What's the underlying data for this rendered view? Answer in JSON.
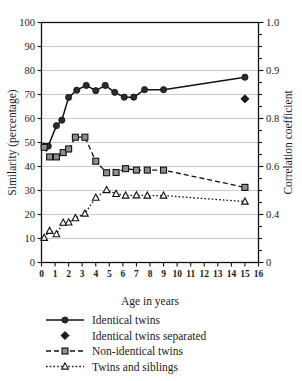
{
  "chart_data": {
    "type": "line",
    "title": "",
    "xlabel": "Age in years",
    "ylabel": "Similarity (percentage)",
    "y2label": "Correlation coefficient",
    "xlim": [
      0,
      16
    ],
    "ylim": [
      0,
      100
    ],
    "grid": true,
    "legend_position": "below",
    "xticks": [
      0,
      1,
      2,
      3,
      4,
      5,
      6,
      7,
      8,
      9,
      10,
      11,
      12,
      13,
      14,
      15,
      16
    ],
    "xtick_labels": [
      "0",
      "1",
      "2",
      "3",
      "4",
      "5",
      "6",
      "7",
      "8",
      "9",
      "10",
      "11",
      "12",
      "13",
      "14",
      "15",
      "16"
    ],
    "yticks": [
      0,
      10,
      20,
      30,
      40,
      50,
      60,
      70,
      80,
      90,
      100
    ],
    "ytick_labels": [
      "0",
      "10",
      "20",
      "30",
      "40",
      "50",
      "60",
      "70",
      "80",
      "90",
      "100"
    ],
    "y2_ticks_at_percent": [
      0,
      20,
      40,
      60,
      80,
      100
    ],
    "y2_tick_labels": [
      "0",
      "0.4",
      "0.6",
      "0.8",
      "0.9",
      "1.0"
    ],
    "y2_minor_ticks_at_percent": [
      5,
      10,
      15,
      25,
      30,
      35,
      45,
      50,
      55,
      65,
      70,
      75,
      85,
      90,
      95
    ],
    "series": [
      {
        "name": "Identical twins",
        "marker": "filled-circle",
        "linestyle": "solid",
        "x": [
          0.2,
          0.5,
          1.1,
          1.5,
          2.0,
          2.6,
          3.3,
          4.0,
          4.7,
          5.4,
          6.1,
          6.8,
          7.6,
          9.0,
          15.0
        ],
        "y": [
          48.5,
          48.5,
          57.0,
          59.3,
          68.8,
          71.8,
          73.8,
          71.6,
          73.8,
          70.9,
          68.9,
          68.9,
          72.0,
          72.0,
          77.2
        ]
      },
      {
        "name": "Identical twins separated",
        "marker": "filled-diamond",
        "linestyle": "none",
        "x": [
          15.0
        ],
        "y": [
          68.2
        ]
      },
      {
        "name": "Non-identical twins",
        "marker": "grey-square",
        "linestyle": "dashed",
        "x": [
          0.2,
          0.6,
          1.1,
          1.6,
          2.0,
          2.5,
          3.2,
          4.0,
          4.8,
          5.5,
          6.2,
          7.0,
          7.8,
          9.0,
          15.0
        ],
        "y": [
          48.0,
          44.0,
          44.0,
          45.8,
          47.3,
          52.2,
          52.2,
          42.2,
          37.4,
          37.5,
          39.1,
          38.5,
          38.5,
          38.5,
          31.3
        ]
      },
      {
        "name": "Twins and siblings",
        "marker": "open-triangle",
        "linestyle": "dotted",
        "x": [
          0.2,
          0.6,
          1.1,
          1.6,
          2.0,
          2.5,
          3.2,
          4.0,
          4.8,
          5.5,
          6.2,
          7.0,
          7.8,
          9.0,
          15.0
        ],
        "y": [
          10.3,
          13.2,
          11.8,
          16.6,
          16.7,
          18.5,
          20.4,
          27.0,
          30.2,
          28.6,
          27.9,
          28.0,
          27.9,
          27.9,
          25.4
        ]
      }
    ],
    "legend": [
      {
        "label": "Identical twins",
        "marker": "filled-circle",
        "linestyle": "solid"
      },
      {
        "label": "Identical twins separated",
        "marker": "filled-diamond",
        "linestyle": "none"
      },
      {
        "label": "Non-identical twins",
        "marker": "grey-square",
        "linestyle": "dashed"
      },
      {
        "label": "Twins and siblings",
        "marker": "open-triangle",
        "linestyle": "dotted"
      }
    ]
  },
  "axes": {
    "xlabel": "Age in years",
    "ylabel": "Similarity (percentage)",
    "y2label": "Correlation coefficient"
  },
  "legend": {
    "item0": "Identical twins",
    "item1": "Identical twins separated",
    "item2": "Non-identical twins",
    "item3": "Twins and siblings"
  },
  "colors": {
    "ink": "#1a1a1a",
    "grid": "#b8b8b8",
    "square_fill": "#8f8f8f",
    "background": "#ffffff"
  }
}
